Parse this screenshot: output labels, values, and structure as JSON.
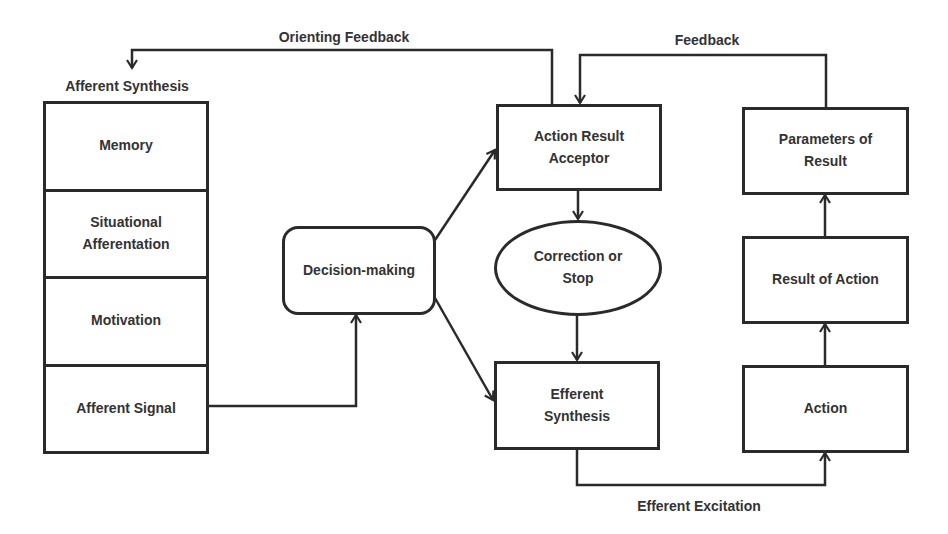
{
  "diagram": {
    "type": "functional-system-flow",
    "colors": {
      "stroke": "#2a2a2a",
      "text": "#333333",
      "background": "#ffffff"
    },
    "edge_labels": {
      "orienting_feedback": "Orienting Feedback",
      "feedback": "Feedback",
      "efferent_excitation": "Efferent Excitation"
    },
    "afferent_synthesis": {
      "title": "Afferent Synthesis",
      "components": [
        {
          "label": "Memory"
        },
        {
          "label": "Situational\nAfferentation"
        },
        {
          "label": "Motivation"
        },
        {
          "label": "Afferent Signal"
        }
      ]
    },
    "nodes": {
      "decision_making": {
        "label": "Decision-making",
        "shape": "rounded-rectangle"
      },
      "action_result_acceptor": {
        "label": "Action Result\nAcceptor",
        "shape": "rectangle"
      },
      "correction_or_stop": {
        "label": "Correction or\nStop",
        "shape": "ellipse"
      },
      "efferent_synthesis": {
        "label": "Efferent\nSynthesis",
        "shape": "rectangle"
      },
      "parameters_of_result": {
        "label": "Parameters of\nResult",
        "shape": "rectangle"
      },
      "result_of_action": {
        "label": "Result of Action",
        "shape": "rectangle"
      },
      "action": {
        "label": "Action",
        "shape": "rectangle"
      }
    },
    "edges": [
      {
        "from": "Afferent Signal",
        "to": "Decision-making"
      },
      {
        "from": "Decision-making",
        "to": "Action Result Acceptor"
      },
      {
        "from": "Decision-making",
        "to": "Efferent Synthesis"
      },
      {
        "from": "Action Result Acceptor",
        "to": "Correction or Stop"
      },
      {
        "from": "Correction or Stop",
        "to": "Efferent Synthesis"
      },
      {
        "from": "Efferent Synthesis",
        "to": "Action",
        "label": "Efferent Excitation"
      },
      {
        "from": "Action",
        "to": "Result of Action"
      },
      {
        "from": "Result of Action",
        "to": "Parameters of Result"
      },
      {
        "from": "Parameters of Result",
        "to": "Action Result Acceptor",
        "label": "Feedback"
      },
      {
        "from": "Action Result Acceptor",
        "to": "Afferent Synthesis",
        "label": "Orienting Feedback"
      }
    ]
  }
}
